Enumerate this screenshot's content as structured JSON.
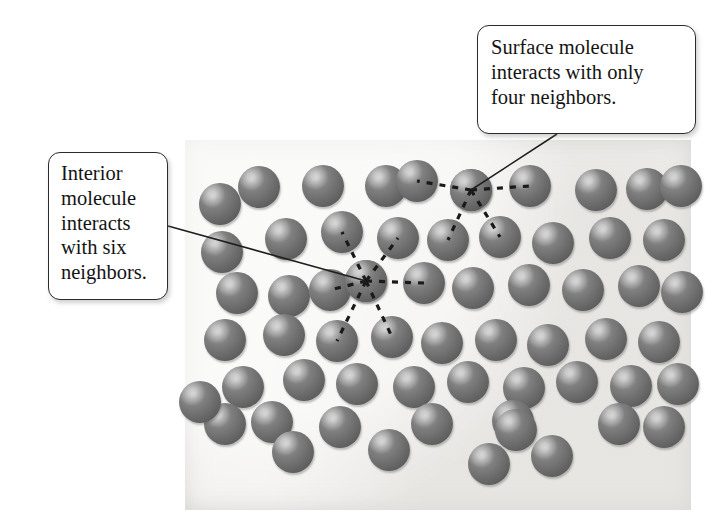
{
  "figure": {
    "background_color": "#ffffff",
    "panel": {
      "x": 185,
      "y": 140,
      "width": 506,
      "height": 370,
      "fill_color": "#f2f1ef"
    }
  },
  "callouts": [
    {
      "id": "surface",
      "text": "Surface molecule\ninteracts with only\nfour neighbors.",
      "x": 477,
      "y": 25,
      "width": 219,
      "height": 109,
      "border_color": "#2b2b2b",
      "fill_color": "#ffffff",
      "leader": {
        "x1": 557,
        "y1": 134,
        "x2": 471,
        "y2": 190
      }
    },
    {
      "id": "interior",
      "text": "Interior\nmolecule\ninteracts\nwith six\nneighbors.",
      "x": 48,
      "y": 152,
      "width": 120,
      "height": 148,
      "border_color": "#2b2b2b",
      "fill_color": "#ffffff",
      "leader": {
        "x1": 168,
        "y1": 226,
        "x2": 366,
        "y2": 281
      }
    }
  ],
  "molecule_style": {
    "radius": 21,
    "base_color": "#6d6d6d",
    "highlight_color": "#b9b9b9",
    "shadow_color": "#3f3f3f"
  },
  "highlighted": {
    "surface_molecule": {
      "cx": 471,
      "cy": 190,
      "neighbor_count": 4
    },
    "interior_molecule": {
      "cx": 366,
      "cy": 281,
      "neighbor_count": 6
    }
  },
  "molecules": [
    {
      "cx": 220,
      "cy": 204
    },
    {
      "cx": 259,
      "cy": 187
    },
    {
      "cx": 323,
      "cy": 186
    },
    {
      "cx": 386,
      "cy": 186
    },
    {
      "cx": 417,
      "cy": 181
    },
    {
      "cx": 471,
      "cy": 190
    },
    {
      "cx": 530,
      "cy": 186
    },
    {
      "cx": 596,
      "cy": 190
    },
    {
      "cx": 647,
      "cy": 189
    },
    {
      "cx": 681,
      "cy": 186
    },
    {
      "cx": 222,
      "cy": 252
    },
    {
      "cx": 286,
      "cy": 239
    },
    {
      "cx": 342,
      "cy": 232
    },
    {
      "cx": 398,
      "cy": 238
    },
    {
      "cx": 448,
      "cy": 240
    },
    {
      "cx": 500,
      "cy": 237
    },
    {
      "cx": 553,
      "cy": 243
    },
    {
      "cx": 610,
      "cy": 238
    },
    {
      "cx": 664,
      "cy": 240
    },
    {
      "cx": 237,
      "cy": 293
    },
    {
      "cx": 289,
      "cy": 296
    },
    {
      "cx": 366,
      "cy": 281
    },
    {
      "cx": 330,
      "cy": 290
    },
    {
      "cx": 424,
      "cy": 283
    },
    {
      "cx": 473,
      "cy": 288
    },
    {
      "cx": 529,
      "cy": 285
    },
    {
      "cx": 583,
      "cy": 290
    },
    {
      "cx": 639,
      "cy": 286
    },
    {
      "cx": 682,
      "cy": 292
    },
    {
      "cx": 225,
      "cy": 340
    },
    {
      "cx": 284,
      "cy": 335
    },
    {
      "cx": 337,
      "cy": 341
    },
    {
      "cx": 392,
      "cy": 337
    },
    {
      "cx": 442,
      "cy": 343
    },
    {
      "cx": 496,
      "cy": 340
    },
    {
      "cx": 548,
      "cy": 345
    },
    {
      "cx": 606,
      "cy": 339
    },
    {
      "cx": 659,
      "cy": 342
    },
    {
      "cx": 243,
      "cy": 387
    },
    {
      "cx": 304,
      "cy": 380
    },
    {
      "cx": 357,
      "cy": 384
    },
    {
      "cx": 414,
      "cy": 387
    },
    {
      "cx": 468,
      "cy": 382
    },
    {
      "cx": 524,
      "cy": 388
    },
    {
      "cx": 577,
      "cy": 382
    },
    {
      "cx": 631,
      "cy": 386
    },
    {
      "cx": 678,
      "cy": 384
    },
    {
      "cx": 225,
      "cy": 424
    },
    {
      "cx": 272,
      "cy": 422
    },
    {
      "cx": 340,
      "cy": 427
    },
    {
      "cx": 432,
      "cy": 424
    },
    {
      "cx": 513,
      "cy": 421
    },
    {
      "cx": 516,
      "cy": 430
    },
    {
      "cx": 619,
      "cy": 424
    },
    {
      "cx": 664,
      "cy": 427
    },
    {
      "cx": 293,
      "cy": 452
    },
    {
      "cx": 389,
      "cy": 450
    },
    {
      "cx": 489,
      "cy": 464
    },
    {
      "cx": 552,
      "cy": 456
    },
    {
      "cx": 200,
      "cy": 402
    }
  ],
  "bonds": {
    "surface": [
      {
        "x1": 471,
        "y1": 190,
        "x2": 417,
        "y2": 181
      },
      {
        "x1": 471,
        "y1": 190,
        "x2": 530,
        "y2": 186
      },
      {
        "x1": 471,
        "y1": 190,
        "x2": 448,
        "y2": 240
      },
      {
        "x1": 471,
        "y1": 190,
        "x2": 500,
        "y2": 237
      }
    ],
    "interior": [
      {
        "x1": 366,
        "y1": 281,
        "x2": 342,
        "y2": 232
      },
      {
        "x1": 366,
        "y1": 281,
        "x2": 398,
        "y2": 238
      },
      {
        "x1": 366,
        "y1": 281,
        "x2": 424,
        "y2": 283
      },
      {
        "x1": 366,
        "y1": 281,
        "x2": 330,
        "y2": 290
      },
      {
        "x1": 366,
        "y1": 281,
        "x2": 337,
        "y2": 341
      },
      {
        "x1": 366,
        "y1": 281,
        "x2": 392,
        "y2": 337
      }
    ]
  }
}
